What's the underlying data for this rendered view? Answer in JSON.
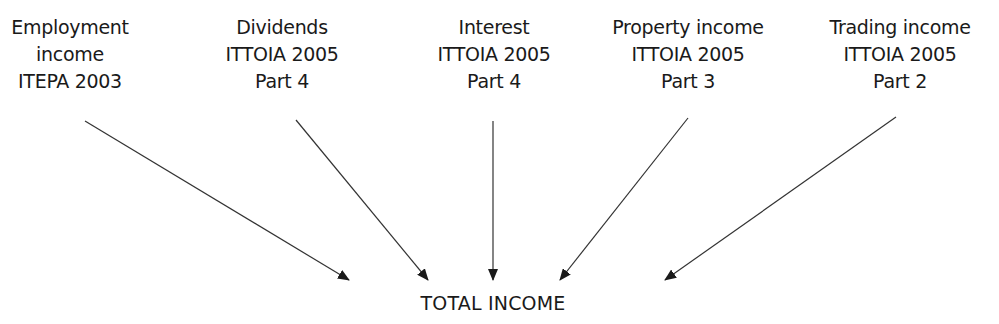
{
  "diagram": {
    "sources": [
      {
        "id": "employment",
        "lines": [
          "Employment",
          "income",
          "ITEPA 2003"
        ],
        "center_x": 70
      },
      {
        "id": "dividends",
        "lines": [
          "Dividends",
          "ITTOIA 2005",
          "Part 4"
        ],
        "center_x": 282
      },
      {
        "id": "interest",
        "lines": [
          "Interest",
          "ITTOIA 2005",
          "Part 4"
        ],
        "center_x": 494
      },
      {
        "id": "property",
        "lines": [
          "Property income",
          "ITTOIA 2005",
          "Part 3"
        ],
        "center_x": 688
      },
      {
        "id": "trading",
        "lines": [
          "Trading income",
          "ITTOIA 2005",
          "Part 2"
        ],
        "center_x": 900
      }
    ],
    "target": {
      "label": "TOTAL INCOME"
    },
    "arrows": [
      {
        "from": "employment",
        "x1": 85,
        "y1": 121,
        "x2": 349,
        "y2": 280
      },
      {
        "from": "dividends",
        "x1": 296,
        "y1": 120,
        "x2": 428,
        "y2": 280
      },
      {
        "from": "interest",
        "x1": 493,
        "y1": 121,
        "x2": 493,
        "y2": 280
      },
      {
        "from": "property",
        "x1": 688,
        "y1": 118,
        "x2": 560,
        "y2": 280
      },
      {
        "from": "trading",
        "x1": 896,
        "y1": 117,
        "x2": 665,
        "y2": 280
      }
    ],
    "colors": {
      "text": "#1a1a1a",
      "arrow": "#333333",
      "background": "#ffffff"
    }
  }
}
